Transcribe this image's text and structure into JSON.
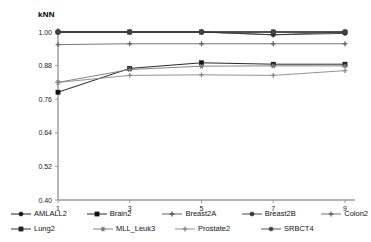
{
  "chart_data": {
    "type": "line",
    "title": "kNN",
    "xlabel": "",
    "ylabel": "",
    "x": [
      1,
      3,
      5,
      7,
      9
    ],
    "xtick_labels": [
      "1",
      "3",
      "5",
      "7",
      "9"
    ],
    "ytick_labels": [
      "0.40",
      "0.52",
      "0.64",
      "0.76",
      "0.88",
      "1.00"
    ],
    "yticks": [
      0.4,
      0.52,
      0.64,
      0.76,
      0.88,
      1.0
    ],
    "ylim": [
      0.4,
      1.0
    ],
    "xlim": [
      1,
      9
    ],
    "grid": false,
    "legend_position": "bottom",
    "series": [
      {
        "name": "AMLALL2",
        "marker": "circle",
        "color": "#111111",
        "values": [
          1.0,
          1.0,
          1.0,
          1.0,
          1.0
        ]
      },
      {
        "name": "Brain2",
        "marker": "square",
        "color": "#111111",
        "values": [
          0.785,
          0.87,
          0.89,
          0.885,
          0.885
        ]
      },
      {
        "name": "Breast2A",
        "marker": "cross",
        "color": "#555555",
        "values": [
          1.0,
          1.0,
          1.0,
          0.99,
          1.0
        ]
      },
      {
        "name": "Breast2B",
        "marker": "circle",
        "color": "#333333",
        "values": [
          1.0,
          1.0,
          1.0,
          0.99,
          0.995
        ]
      },
      {
        "name": "Colon2",
        "marker": "cross",
        "color": "#666666",
        "values": [
          0.955,
          0.958,
          0.958,
          0.958,
          0.958
        ]
      },
      {
        "name": "Lung2",
        "marker": "square",
        "color": "#222222",
        "values": [
          1.0,
          1.0,
          1.0,
          1.0,
          1.0
        ]
      },
      {
        "name": "MLL_Leuk3",
        "marker": "star",
        "color": "#777777",
        "values": [
          0.82,
          0.866,
          0.878,
          0.879,
          0.879
        ]
      },
      {
        "name": "Prostate2",
        "marker": "cross",
        "color": "#888888",
        "values": [
          0.82,
          0.845,
          0.847,
          0.845,
          0.862
        ]
      },
      {
        "name": "SRBCT4",
        "marker": "circle",
        "color": "#444444",
        "values": [
          1.0,
          1.0,
          1.0,
          1.0,
          1.0
        ]
      }
    ]
  },
  "legend": {
    "rows": [
      [
        {
          "label": "AMLALL2"
        },
        {
          "label": "Brain2"
        },
        {
          "label": "Breast2A"
        },
        {
          "label": "Breast2B"
        },
        {
          "label": "Colon2"
        }
      ],
      [
        {
          "label": "Lung2"
        },
        {
          "label": "MLL_Leuk3"
        },
        {
          "label": "Prostate2"
        },
        {
          "label": "SRBCT4"
        }
      ]
    ]
  },
  "axis": {
    "color": "#9a9a9a"
  }
}
